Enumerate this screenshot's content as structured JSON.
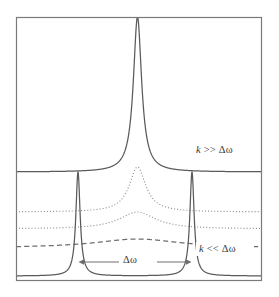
{
  "figure": {
    "title": "",
    "frame": {
      "x": 16,
      "y": 17,
      "width": 246,
      "height": 264,
      "stroke": "#7a7a7a"
    },
    "background": "#ffffff"
  },
  "annotations": {
    "label_strong_coupling": "k >> Δω",
    "label_weak_coupling": "k << Δω",
    "label_splitting": "Δω",
    "arrow_name": "splitting-arrow"
  },
  "colors": {
    "curve_solid": "#5a5a5a",
    "curve_dotted": "#8c8c8c",
    "curve_dashed": "#6e6e6e",
    "frame": "#7a7a7a",
    "text": "#3a3a3a"
  },
  "chart_data": {
    "type": "line",
    "title": "",
    "xlabel": "",
    "ylabel": "",
    "xlim": [
      0,
      1
    ],
    "ylim": [
      0,
      1
    ],
    "grid": false,
    "legend": "none",
    "peak_centers_normalized": [
      0.252,
      0.492,
      0.715
    ],
    "splitting_delta_omega_normalized": 0.463,
    "series": [
      {
        "name": "k >> Δω",
        "style": "solid",
        "baseline_y": 172,
        "peaks": [
          {
            "center_x": 137.5,
            "height": 155,
            "halfwidth": 5.0
          }
        ],
        "label": "k >> Δω"
      },
      {
        "name": "intermediate-fast",
        "style": "dotted",
        "baseline_y": 212,
        "peaks": [
          {
            "center_x": 137.5,
            "height": 45,
            "halfwidth": 10.0
          }
        ],
        "label": ""
      },
      {
        "name": "intermediate-slow",
        "style": "dotted",
        "baseline_y": 229,
        "peaks": [
          {
            "center_x": 137.5,
            "height": 17,
            "halfwidth": 22.0
          }
        ],
        "label": ""
      },
      {
        "name": "near-coalescence",
        "style": "dashed",
        "baseline_y": 248,
        "peaks": [
          {
            "center_x": 137.5,
            "height": 9,
            "halfwidth": 52.0
          }
        ],
        "label": ""
      },
      {
        "name": "k << Δω",
        "style": "solid",
        "baseline_y": 276,
        "peaks": [
          {
            "center_x": 78.0,
            "height": 104,
            "halfwidth": 2.6
          },
          {
            "center_x": 192.0,
            "height": 104,
            "halfwidth": 2.6
          }
        ],
        "label": "k << Δω"
      }
    ]
  }
}
